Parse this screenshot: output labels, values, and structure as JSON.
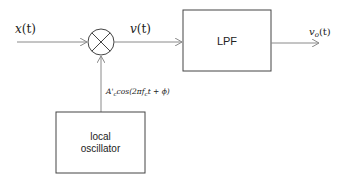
{
  "diagram": {
    "type": "block-diagram",
    "colors": {
      "line": "#8a8a8a",
      "box": "#444444",
      "text": "#222222"
    },
    "signals": {
      "input": {
        "base": "x",
        "arg": "(t)"
      },
      "mixer_output": {
        "base": "v",
        "arg": "(t)"
      },
      "output": {
        "base": "v",
        "sub": "o",
        "arg": "(t)"
      },
      "lo_signal": {
        "amp": "A",
        "prime": "'",
        "amp_sub": "c",
        "text_pre": "cos(2π",
        "freq": "f",
        "freq_sub": "c",
        "text_post": "t + ϕ)"
      }
    },
    "blocks": {
      "mixer": {
        "symbol": "multiplier-circle-x"
      },
      "lpf": {
        "label": "LPF"
      },
      "local_oscillator": {
        "line1": "local",
        "line2": "oscillator"
      }
    }
  }
}
